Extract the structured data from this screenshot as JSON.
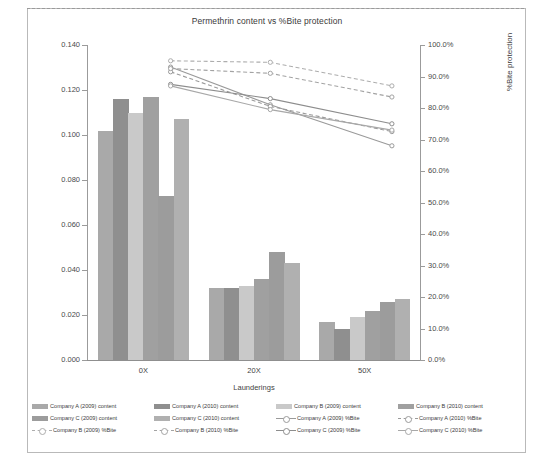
{
  "chart_data": {
    "type": "bar",
    "title": "Permethrin content vs %Bite protection",
    "xlabel": "Launderings",
    "ylabel": "Permethrin content (mg/cm²)",
    "ylabel_secondary": "%Bite protection",
    "categories": [
      "0X",
      "20X",
      "50X"
    ],
    "ylim": [
      0,
      0.14
    ],
    "yticks": [
      "0.000",
      "0.020",
      "0.040",
      "0.060",
      "0.080",
      "0.100",
      "0.120",
      "0.140"
    ],
    "ylim_secondary": [
      0,
      100
    ],
    "yticks_secondary": [
      "0.0%",
      "10.0%",
      "20.0%",
      "30.0%",
      "40.0%",
      "50.0%",
      "60.0%",
      "70.0%",
      "80.0%",
      "90.0%",
      "100.0%"
    ],
    "grid": false,
    "legend_position": "bottom",
    "bar_series": [
      {
        "name": "Company A (2009) content",
        "color": "#a9a9a9",
        "values": [
          0.102,
          0.032,
          0.017
        ]
      },
      {
        "name": "Company A (2010) content",
        "color": "#8f8f8f",
        "values": [
          0.116,
          0.032,
          0.014
        ]
      },
      {
        "name": "Company B (2009) content",
        "color": "#c9c9c9",
        "values": [
          0.11,
          0.033,
          0.019
        ]
      },
      {
        "name": "Company B (2010) content",
        "color": "#a0a0a0",
        "values": [
          0.117,
          0.036,
          0.022
        ]
      },
      {
        "name": "Company C (2009) content",
        "color": "#9c9c9c",
        "values": [
          0.073,
          0.048,
          0.026
        ]
      },
      {
        "name": "Company C (2010) content",
        "color": "#b0b0b0",
        "values": [
          0.107,
          0.043,
          0.027
        ]
      }
    ],
    "line_series": [
      {
        "name": "Company A (2009) %Bite",
        "color": "#9a9a9a",
        "dash": "solid",
        "values": [
          93.0,
          81.0,
          68.0
        ]
      },
      {
        "name": "Company A (2010) %Bite",
        "color": "#9a9a9a",
        "dash": "dashed",
        "values": [
          91.5,
          80.5,
          72.5
        ]
      },
      {
        "name": "Company B (2009) %Bite",
        "color": "#adadad",
        "dash": "dashed",
        "values": [
          95.0,
          94.5,
          87.0
        ]
      },
      {
        "name": "Company B (2010) %Bite",
        "color": "#a3a3a3",
        "dash": "dashed",
        "values": [
          92.5,
          91.0,
          83.5
        ]
      },
      {
        "name": "Company C (2009) %Bite",
        "color": "#8d8d8d",
        "dash": "solid",
        "values": [
          87.5,
          83.0,
          75.0
        ]
      },
      {
        "name": "Company C (2010) %Bite",
        "color": "#a8a8a8",
        "dash": "solid",
        "values": [
          87.0,
          79.5,
          73.0
        ]
      }
    ]
  }
}
